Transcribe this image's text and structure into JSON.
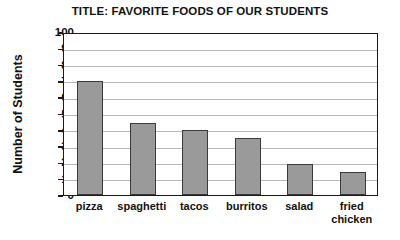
{
  "chart_data": {
    "type": "bar",
    "title": "TITLE: FAVORITE FOODS OF OUR STUDENTS",
    "xlabel": "",
    "ylabel": "Number of Students",
    "categories": [
      "pizza",
      "spaghetti",
      "tacos",
      "burritos",
      "salad",
      "fried\nchicken"
    ],
    "values": [
      70,
      44,
      40,
      35,
      19,
      14
    ],
    "ylim": [
      0,
      100
    ],
    "ytick_labels": [
      "100",
      "90",
      "80",
      "70",
      "60",
      "50",
      "40",
      "30",
      "20",
      "10",
      "0"
    ],
    "ytick_values": [
      100,
      90,
      80,
      70,
      60,
      50,
      40,
      30,
      20,
      10,
      0
    ],
    "grid": true,
    "legend": false,
    "bar_color": "#9a9a9a",
    "bar_border_color": "#3a3a3a",
    "axis_color": "#1a1a1a",
    "grid_color": "#b8b8b8",
    "background": "#ffffff"
  }
}
